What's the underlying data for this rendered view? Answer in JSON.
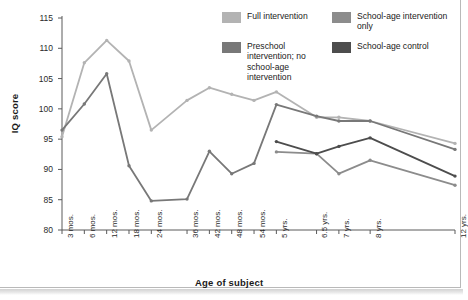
{
  "chart_data": {
    "type": "line",
    "title": "",
    "xlabel": "Age of subject",
    "ylabel": "IQ score",
    "ylim": [
      80,
      115
    ],
    "yticks": [
      80,
      85,
      90,
      95,
      100,
      105,
      110,
      115
    ],
    "grid": false,
    "legend_position": "top-right",
    "categories": [
      "3 mos.",
      "6 mos.",
      "12 mos.",
      "18 mos.",
      "24 mos.",
      "36 mos.",
      "42 mos.",
      "48 mos.",
      "54 mos.",
      "5 yrs.",
      "6.5 yrs.",
      "7 yrs.",
      "8 yrs.",
      "12 yrs."
    ],
    "category_positions": [
      0,
      1,
      2,
      3,
      4,
      5.6,
      6.6,
      7.6,
      8.6,
      9.6,
      11.4,
      12.4,
      13.8,
      17.6
    ],
    "series": [
      {
        "name": "Full intervention",
        "color": "#b3b3b3",
        "values": [
          95.4,
          107.6,
          111.3,
          107.9,
          96.5,
          101.4,
          103.5,
          102.4,
          101.4,
          102.8,
          98.6,
          98.6,
          98.0,
          94.3
        ]
      },
      {
        "name": "Preschool intervention; no school-age intervention",
        "color": "#787878",
        "values": [
          96.5,
          100.8,
          105.8,
          90.6,
          84.8,
          85.1,
          93.0,
          89.3,
          91.0,
          100.7,
          98.8,
          98.0,
          98.0,
          93.3
        ]
      },
      {
        "name": "School-age intervention only",
        "color": "#8c8c8c",
        "values": [
          null,
          null,
          null,
          null,
          null,
          null,
          null,
          null,
          null,
          92.9,
          92.6,
          89.3,
          91.5,
          87.4
        ]
      },
      {
        "name": "School-age control",
        "color": "#4d4d4d",
        "values": [
          null,
          null,
          null,
          null,
          null,
          null,
          null,
          null,
          null,
          94.6,
          92.6,
          93.8,
          95.2,
          88.9
        ]
      }
    ]
  },
  "legend": {
    "items": [
      {
        "label": "Full intervention",
        "color": "#b3b3b3"
      },
      {
        "label": "School-age intervention only",
        "color": "#8c8c8c"
      },
      {
        "label": "Preschool intervention; no school-age intervention",
        "color": "#787878"
      },
      {
        "label": "School-age control",
        "color": "#4d4d4d"
      }
    ]
  },
  "axes": {
    "y_title": "IQ score",
    "x_title": "Age of subject",
    "y_tick_labels": [
      "115",
      "110",
      "105",
      "100",
      "95",
      "90",
      "85",
      "80"
    ],
    "x_tick_labels": [
      "3 mos.",
      "6 mos.",
      "12 mos.",
      "18 mos.",
      "24 mos.",
      "36 mos.",
      "42 mos.",
      "48 mos.",
      "54 mos.",
      "5 yrs.",
      "6.5 yrs.",
      "7 yrs.",
      "8 yrs.",
      "12 yrs."
    ]
  }
}
